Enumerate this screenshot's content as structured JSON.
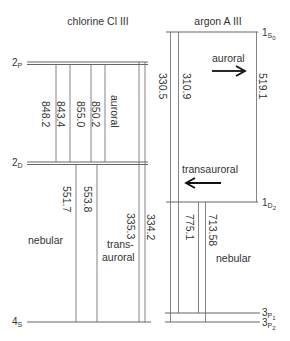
{
  "chlorine": {
    "title": "chlorine Cl III",
    "levels": {
      "2P": {
        "main": "2",
        "sub": "P"
      },
      "2D": {
        "main": "2",
        "sub": "D"
      },
      "4S": {
        "main": "4",
        "sub": "S"
      }
    },
    "transitions": {
      "t1": "848.2",
      "t2": "843.4",
      "t3": "855.0",
      "t4": "850.2",
      "t5": "551.7",
      "t6": "553.8",
      "t7": "335.3",
      "t8": "334.2"
    },
    "labels": {
      "auroral": "auroral",
      "nebular": "nebular",
      "trans1": "trans-",
      "trans2": "auroral"
    }
  },
  "argon": {
    "title": "argon A III",
    "levels": {
      "1S0": {
        "main": "1",
        "sub": "S",
        "subsub": "0"
      },
      "1D2": {
        "main": "1",
        "sub": "D",
        "subsub": "2"
      },
      "3P1": {
        "main": "3",
        "sub": "P",
        "subsub": "1"
      },
      "3P2": {
        "main": "3",
        "sub": "P",
        "subsub": "2"
      }
    },
    "transitions": {
      "t1": "330.5",
      "t2": "310.9",
      "t3": "519.1",
      "t4": "775.1",
      "t5": "713.58"
    },
    "labels": {
      "auroral": "auroral",
      "transauroral": "transauroral",
      "nebular": "nebular"
    }
  }
}
